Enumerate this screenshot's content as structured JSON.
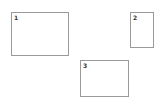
{
  "diagram": {
    "boxes": [
      {
        "label": "1"
      },
      {
        "label": "2"
      },
      {
        "label": "3"
      }
    ],
    "colors": {
      "background": "#ffffff",
      "border": "#9a9a9a",
      "label": "#333333"
    }
  }
}
